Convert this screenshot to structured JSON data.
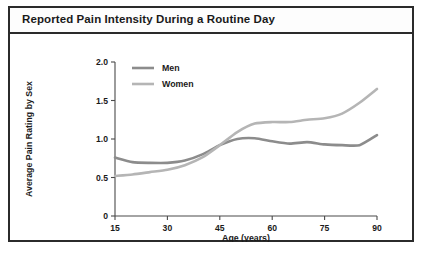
{
  "chart_title": "Reported Pain Intensity During a Routine Day",
  "chart_data": {
    "type": "line",
    "title": "Reported Pain Intensity During a Routine Day",
    "xlabel": "Age (years)",
    "ylabel": "Average Pain Rating by Sex",
    "xlim": [
      15,
      90
    ],
    "ylim": [
      0,
      2.0
    ],
    "xticks": [
      15,
      30,
      45,
      60,
      75,
      90
    ],
    "xtick_labels": [
      "15",
      "30",
      "45",
      "60",
      "75",
      "90"
    ],
    "yticks": [
      0,
      0.5,
      1.0,
      1.5,
      2.0
    ],
    "ytick_labels": [
      "0",
      "0.5",
      "1.0",
      "1.5",
      "2.0"
    ],
    "grid": false,
    "legend_position": "top-left-inside",
    "x": [
      15,
      20,
      25,
      30,
      35,
      40,
      45,
      50,
      55,
      60,
      65,
      70,
      75,
      80,
      85,
      90
    ],
    "series": [
      {
        "name": "Men",
        "color": "#8c8c8c",
        "values": [
          0.76,
          0.7,
          0.69,
          0.69,
          0.72,
          0.8,
          0.92,
          1.0,
          1.01,
          0.97,
          0.94,
          0.96,
          0.93,
          0.92,
          0.92,
          1.05
        ]
      },
      {
        "name": "Women",
        "color": "#b5b5b5",
        "values": [
          0.52,
          0.54,
          0.57,
          0.6,
          0.66,
          0.76,
          0.92,
          1.09,
          1.2,
          1.22,
          1.22,
          1.25,
          1.27,
          1.33,
          1.47,
          1.65
        ]
      }
    ]
  },
  "legend": {
    "items": [
      {
        "label": "Men",
        "color": "#8c8c8c"
      },
      {
        "label": "Women",
        "color": "#b5b5b5"
      }
    ]
  },
  "colors": {
    "men": "#8c8c8c",
    "women": "#b5b5b5",
    "axis": "#4a4a4a",
    "border": "#2b2b2b",
    "text": "#1a1a1a",
    "background": "#ffffff"
  }
}
